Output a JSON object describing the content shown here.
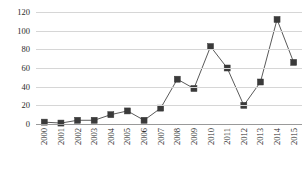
{
  "chart_data": {
    "type": "line",
    "title": "",
    "subtitle": "",
    "xlabel": "",
    "ylabel": "",
    "categories": [
      "2000",
      "2001",
      "2002",
      "2003",
      "2004",
      "2005",
      "2006",
      "2007",
      "2008",
      "2009",
      "2010",
      "2011",
      "2012",
      "2013",
      "2014",
      "2015"
    ],
    "values": [
      2,
      1,
      4,
      4,
      10,
      14,
      4,
      17,
      48,
      38,
      83,
      60,
      20,
      45,
      112,
      66
    ],
    "series": [
      {
        "name": "series-1",
        "values": [
          2,
          1,
          4,
          4,
          10,
          14,
          4,
          17,
          48,
          38,
          83,
          60,
          20,
          45,
          112,
          66
        ]
      }
    ],
    "ylim": [
      0,
      120
    ],
    "yticks": [
      0,
      20,
      40,
      60,
      80,
      100,
      120
    ],
    "ytick_labels": [
      "0",
      "20",
      "40",
      "60",
      "80",
      "100",
      "120"
    ],
    "grid": true,
    "legend": false,
    "legend_position": "none",
    "marker": "square",
    "line_color": "#5a5a5a",
    "marker_color": "#3a3a3a",
    "grid_color": "#d6d6d6",
    "axis_color": "#9a9a9a",
    "background_color": "#ffffff"
  }
}
